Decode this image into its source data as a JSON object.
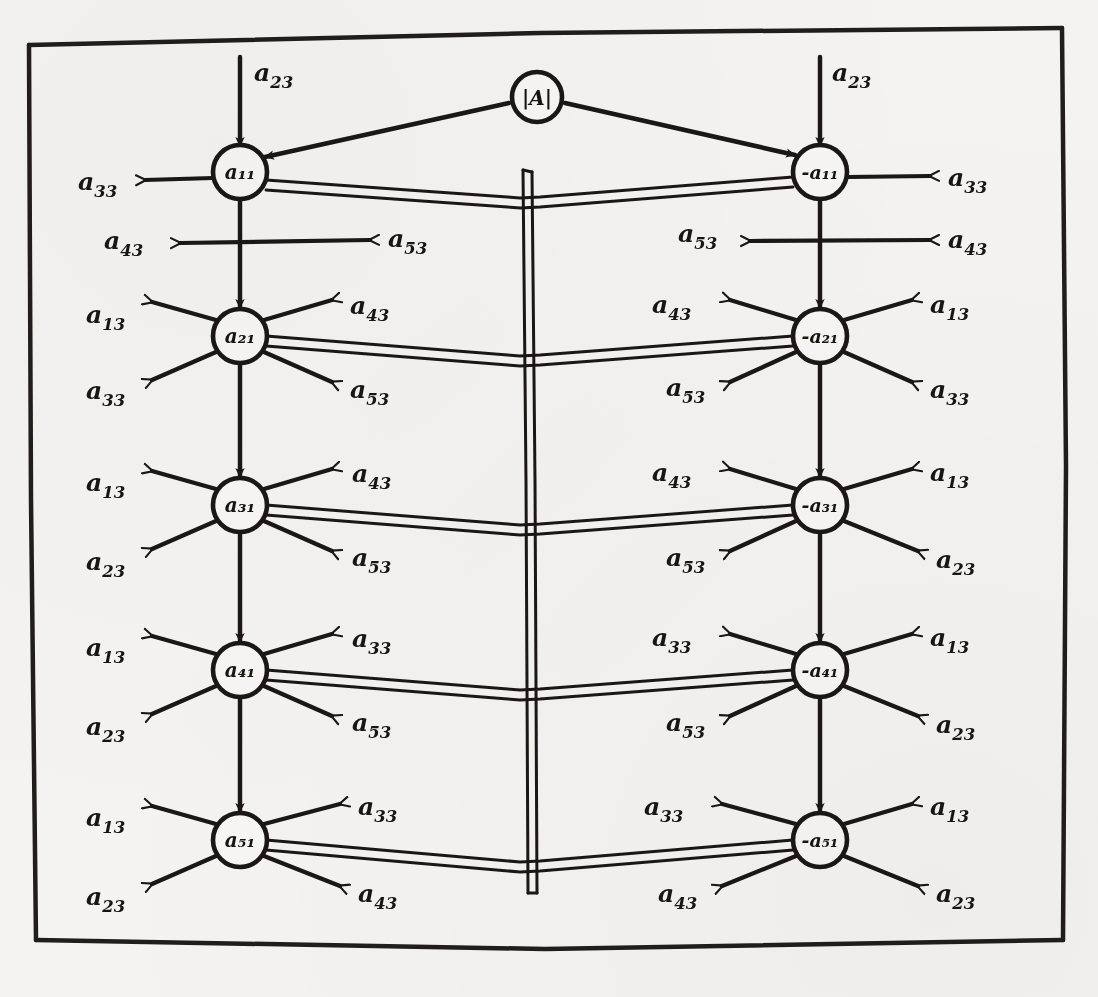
{
  "figure": {
    "kind": "hand-drawn signal flow graph / matrix inversion network",
    "ink_color": "#1a1714",
    "paper_color": "#f4f3f1",
    "frame": {
      "label": "hand-drawn rectangular border"
    }
  },
  "source_node": {
    "id": "A-det",
    "label": "|A|"
  },
  "columns": [
    {
      "id": "left",
      "sign": "positive",
      "x": 240
    },
    {
      "id": "right",
      "sign": "negative",
      "x": 820
    }
  ],
  "rows": [
    {
      "index": 1,
      "y": 172,
      "left_node": "a₁₁",
      "right_node": "-a₁₁",
      "left": {
        "top_in": "a23",
        "side_in": "a33",
        "cross_left": "a43",
        "cross_right": "a53"
      },
      "right": {
        "top_in": "a23",
        "side_out": "a33",
        "cross_left": "a53",
        "cross_right": "a43"
      }
    },
    {
      "index": 2,
      "y": 336,
      "left_node": "a₂₁",
      "right_node": "-a₂₁",
      "left": {
        "upper_left": "a13",
        "lower_left": "a33",
        "upper_right": "a43",
        "lower_right": "a53"
      },
      "right": {
        "upper_left": "a43",
        "lower_left": "a53",
        "upper_right": "a13",
        "lower_right": "a33"
      }
    },
    {
      "index": 3,
      "y": 505,
      "left_node": "a₃₁",
      "right_node": "-a₃₁",
      "left": {
        "upper_left": "a13",
        "lower_left": "a23",
        "upper_right": "a43",
        "lower_right": "a53"
      },
      "right": {
        "upper_left": "a43",
        "lower_left": "a53",
        "upper_right": "a13",
        "lower_right": "a23"
      }
    },
    {
      "index": 4,
      "y": 670,
      "left_node": "a₄₁",
      "right_node": "-a₄₁",
      "left": {
        "upper_left": "a13",
        "lower_left": "a23",
        "upper_right": "a33",
        "lower_right": "a53"
      },
      "right": {
        "upper_left": "a33",
        "lower_left": "a53",
        "upper_right": "a13",
        "lower_right": "a23"
      }
    },
    {
      "index": 5,
      "y": 840,
      "left_node": "a₅₁",
      "right_node": "-a₅₁",
      "left": {
        "upper_left": "a13",
        "lower_left": "a23",
        "upper_right": "a33",
        "lower_right": "a43"
      },
      "right": {
        "upper_left": "a33",
        "lower_left": "a43",
        "upper_right": "a13",
        "lower_right": "a23"
      }
    }
  ],
  "labels": {
    "r1_left_top": {
      "base": "a",
      "sub": "23"
    },
    "r1_left_side": {
      "base": "a",
      "sub": "33"
    },
    "r1_left_crossL": {
      "base": "a",
      "sub": "43"
    },
    "r1_left_crossR": {
      "base": "a",
      "sub": "53"
    },
    "r1_right_top": {
      "base": "a",
      "sub": "23"
    },
    "r1_right_side": {
      "base": "a",
      "sub": "33"
    },
    "r1_right_crossL": {
      "base": "a",
      "sub": "53"
    },
    "r1_right_crossR": {
      "base": "a",
      "sub": "43"
    },
    "r2_left_ul": {
      "base": "a",
      "sub": "13"
    },
    "r2_left_ll": {
      "base": "a",
      "sub": "33"
    },
    "r2_left_ur": {
      "base": "a",
      "sub": "43"
    },
    "r2_left_lr": {
      "base": "a",
      "sub": "53"
    },
    "r2_right_ul": {
      "base": "a",
      "sub": "43"
    },
    "r2_right_ll": {
      "base": "a",
      "sub": "53"
    },
    "r2_right_ur": {
      "base": "a",
      "sub": "13"
    },
    "r2_right_lr": {
      "base": "a",
      "sub": "33"
    },
    "r3_left_ul": {
      "base": "a",
      "sub": "13"
    },
    "r3_left_ll": {
      "base": "a",
      "sub": "23"
    },
    "r3_left_ur": {
      "base": "a",
      "sub": "43"
    },
    "r3_left_lr": {
      "base": "a",
      "sub": "53"
    },
    "r3_right_ul": {
      "base": "a",
      "sub": "43"
    },
    "r3_right_ll": {
      "base": "a",
      "sub": "53"
    },
    "r3_right_ur": {
      "base": "a",
      "sub": "13"
    },
    "r3_right_lr": {
      "base": "a",
      "sub": "23"
    },
    "r4_left_ul": {
      "base": "a",
      "sub": "13"
    },
    "r4_left_ll": {
      "base": "a",
      "sub": "23"
    },
    "r4_left_ur": {
      "base": "a",
      "sub": "33"
    },
    "r4_left_lr": {
      "base": "a",
      "sub": "53"
    },
    "r4_right_ul": {
      "base": "a",
      "sub": "33"
    },
    "r4_right_ll": {
      "base": "a",
      "sub": "53"
    },
    "r4_right_ur": {
      "base": "a",
      "sub": "13"
    },
    "r4_right_lr": {
      "base": "a",
      "sub": "23"
    },
    "r5_left_ul": {
      "base": "a",
      "sub": "13"
    },
    "r5_left_ll": {
      "base": "a",
      "sub": "23"
    },
    "r5_left_ur": {
      "base": "a",
      "sub": "33"
    },
    "r5_left_lr": {
      "base": "a",
      "sub": "43"
    },
    "r5_right_ul": {
      "base": "a",
      "sub": "33"
    },
    "r5_right_ll": {
      "base": "a",
      "sub": "43"
    },
    "r5_right_ur": {
      "base": "a",
      "sub": "13"
    },
    "r5_right_lr": {
      "base": "a",
      "sub": "23"
    }
  },
  "nodes": {
    "det": "|A|",
    "l1": "a₁₁",
    "l2": "a₂₁",
    "l3": "a₃₁",
    "l4": "a₄₁",
    "l5": "a₅₁",
    "r1": "-a₁₁",
    "r2": "-a₂₁",
    "r3": "-a₃₁",
    "r4": "-a₄₁",
    "r5": "-a₅₁"
  }
}
